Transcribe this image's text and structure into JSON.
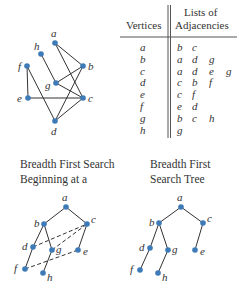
{
  "colors": {
    "node": "#3d7ab8",
    "edge": "#333333",
    "text": "#333333"
  },
  "graph": {
    "nodes": [
      {
        "id": "a",
        "x": 55,
        "y": 43,
        "lx": 51,
        "ly": 37
      },
      {
        "id": "b",
        "x": 83,
        "y": 66,
        "lx": 88,
        "ly": 70
      },
      {
        "id": "c",
        "x": 83,
        "y": 98,
        "lx": 88,
        "ly": 102
      },
      {
        "id": "d",
        "x": 55,
        "y": 121,
        "lx": 51,
        "ly": 135
      },
      {
        "id": "e",
        "x": 28,
        "y": 98,
        "lx": 17,
        "ly": 102
      },
      {
        "id": "f",
        "x": 27,
        "y": 66,
        "lx": 18,
        "ly": 70
      },
      {
        "id": "g",
        "x": 56,
        "y": 83,
        "lx": 45,
        "ly": 89
      },
      {
        "id": "h",
        "x": 41,
        "y": 54,
        "lx": 34,
        "ly": 50
      }
    ],
    "edges": [
      [
        "a",
        "b"
      ],
      [
        "a",
        "c"
      ],
      [
        "b",
        "g"
      ],
      [
        "b",
        "d"
      ],
      [
        "c",
        "g"
      ],
      [
        "c",
        "e"
      ],
      [
        "c",
        "d"
      ],
      [
        "d",
        "f"
      ],
      [
        "e",
        "f"
      ],
      [
        "g",
        "h"
      ]
    ]
  },
  "table": {
    "header_vertices": "Vertices",
    "header_lists_line1": "Lists of",
    "header_lists_line2": "Adjacencies",
    "rows": [
      {
        "vertex": "a",
        "adj": [
          "b",
          "c"
        ]
      },
      {
        "vertex": "b",
        "adj": [
          "a",
          "d",
          "g"
        ]
      },
      {
        "vertex": "c",
        "adj": [
          "a",
          "d",
          "e",
          "g"
        ]
      },
      {
        "vertex": "d",
        "adj": [
          "c",
          "b",
          "f"
        ]
      },
      {
        "vertex": "e",
        "adj": [
          "c",
          "f"
        ]
      },
      {
        "vertex": "f",
        "adj": [
          "e",
          "d"
        ]
      },
      {
        "vertex": "g",
        "adj": [
          "b",
          "c",
          "h"
        ]
      },
      {
        "vertex": "h",
        "adj": [
          "g"
        ]
      }
    ]
  },
  "bfs": {
    "caption_line1": "Breadth First Search",
    "caption_line2": "Beginning at a",
    "nodes": [
      {
        "id": "a",
        "x": 66,
        "y": 207,
        "lx": 62,
        "ly": 201
      },
      {
        "id": "b",
        "x": 44,
        "y": 224,
        "lx": 34,
        "ly": 227
      },
      {
        "id": "c",
        "x": 87,
        "y": 224,
        "lx": 91,
        "ly": 223
      },
      {
        "id": "d",
        "x": 33,
        "y": 247,
        "lx": 22,
        "ly": 250
      },
      {
        "id": "g",
        "x": 52,
        "y": 250,
        "lx": 56,
        "ly": 253
      },
      {
        "id": "e",
        "x": 78,
        "y": 250,
        "lx": 83,
        "ly": 255
      },
      {
        "id": "f",
        "x": 25,
        "y": 269,
        "lx": 14,
        "ly": 272
      },
      {
        "id": "h",
        "x": 43,
        "y": 273,
        "lx": 47,
        "ly": 281
      }
    ],
    "tree_edges": [
      [
        "a",
        "b"
      ],
      [
        "a",
        "c"
      ],
      [
        "b",
        "d"
      ],
      [
        "b",
        "g"
      ],
      [
        "c",
        "e"
      ],
      [
        "d",
        "f"
      ],
      [
        "g",
        "h"
      ]
    ],
    "cross_edges": [
      [
        "d",
        "c"
      ],
      [
        "g",
        "c"
      ],
      [
        "f",
        "e"
      ]
    ]
  },
  "tree": {
    "caption_line1": "Breadth First",
    "caption_line2": "Search Tree",
    "nodes": [
      {
        "id": "a",
        "x": 181,
        "y": 207,
        "lx": 177,
        "ly": 201
      },
      {
        "id": "b",
        "x": 159,
        "y": 223,
        "lx": 149,
        "ly": 226
      },
      {
        "id": "c",
        "x": 203,
        "y": 223,
        "lx": 207,
        "ly": 222
      },
      {
        "id": "d",
        "x": 150,
        "y": 248,
        "lx": 139,
        "ly": 251
      },
      {
        "id": "g",
        "x": 168,
        "y": 250,
        "lx": 172,
        "ly": 253
      },
      {
        "id": "e",
        "x": 195,
        "y": 250,
        "lx": 200,
        "ly": 255
      },
      {
        "id": "f",
        "x": 140,
        "y": 270,
        "lx": 130,
        "ly": 273
      },
      {
        "id": "h",
        "x": 158,
        "y": 273,
        "lx": 162,
        "ly": 281
      }
    ],
    "edges": [
      [
        "a",
        "b"
      ],
      [
        "a",
        "c"
      ],
      [
        "b",
        "d"
      ],
      [
        "b",
        "g"
      ],
      [
        "c",
        "e"
      ],
      [
        "d",
        "f"
      ],
      [
        "g",
        "h"
      ]
    ]
  }
}
